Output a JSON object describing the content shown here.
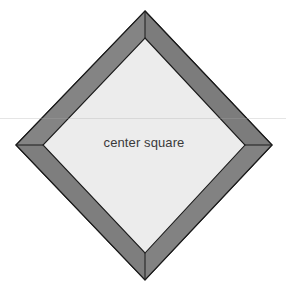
{
  "figure": {
    "background_color": "#ffffff",
    "canvas": {
      "width": 286,
      "height": 292
    },
    "label": {
      "text": "center square",
      "x": 144,
      "y": 147,
      "font_size": 13,
      "color": "#3a3a3a"
    },
    "outer_diamond": {
      "name": "outer-diamond",
      "fill_color": "#808080",
      "stroke_color": "#1a1a1a",
      "stroke_width": 1.2,
      "points": "145,11 272,145 145,280 16,145",
      "vertices": {
        "top": [
          145,
          11
        ],
        "right": [
          272,
          145
        ],
        "bottom": [
          145,
          280
        ],
        "left": [
          16,
          145
        ]
      }
    },
    "inner_diamond": {
      "name": "inner-diamond",
      "fill_color": "#ececec",
      "stroke_color": "#1a1a1a",
      "stroke_width": 1.1,
      "points": "145,38 245,145 145,253 43,145",
      "vertices": {
        "top": [
          145,
          38
        ],
        "right": [
          245,
          145
        ],
        "bottom": [
          145,
          253
        ],
        "left": [
          43,
          145
        ]
      }
    },
    "border_band": {
      "name": "border-band",
      "color": "#808080",
      "miter_seam_color": "#1a1a1a",
      "perpendicular_width": 19,
      "segments": [
        {
          "name": "border-segment-top-left",
          "points": "145,11 145,38 43,145 16,145"
        },
        {
          "name": "border-segment-top-right",
          "points": "145,11 272,145 245,145 145,38"
        },
        {
          "name": "border-segment-bottom-right",
          "points": "272,145 145,280 145,253 245,145"
        },
        {
          "name": "border-segment-bottom-left",
          "points": "16,145 43,145 145,253 145,280"
        }
      ],
      "miter_seams": [
        {
          "name": "miter-seam-top",
          "x1": 145,
          "y1": 11,
          "x2": 145,
          "y2": 38
        },
        {
          "name": "miter-seam-right",
          "x1": 272,
          "y1": 145,
          "x2": 245,
          "y2": 145
        },
        {
          "name": "miter-seam-bottom",
          "x1": 145,
          "y1": 280,
          "x2": 145,
          "y2": 253
        },
        {
          "name": "miter-seam-left",
          "x1": 16,
          "y1": 145,
          "x2": 43,
          "y2": 145
        }
      ]
    },
    "scan_artifact": {
      "name": "scan-line-artifact",
      "y": 118
    }
  }
}
